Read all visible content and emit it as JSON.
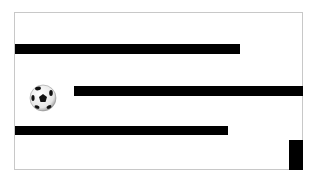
{
  "game": {
    "frame": {
      "x": 14,
      "y": 12,
      "width": 289,
      "height": 158,
      "border_color": "#c8c8c8",
      "background": "#ffffff"
    },
    "walls": [
      {
        "id": "wall-1",
        "x": 15,
        "y": 44,
        "width": 225,
        "height": 10,
        "color": "#000000"
      },
      {
        "id": "wall-2",
        "x": 74,
        "y": 86,
        "width": 229,
        "height": 10,
        "color": "#000000"
      },
      {
        "id": "wall-3",
        "x": 15,
        "y": 126,
        "width": 213,
        "height": 9,
        "color": "#000000"
      },
      {
        "id": "block",
        "x": 289,
        "y": 140,
        "width": 14,
        "height": 30,
        "color": "#000000"
      }
    ],
    "ball": {
      "icon": "soccer-ball-icon",
      "cx": 43,
      "cy": 98,
      "r": 13
    }
  }
}
